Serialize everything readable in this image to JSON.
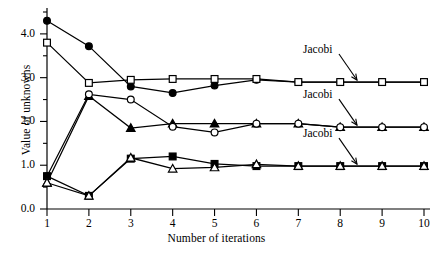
{
  "chart_data": {
    "type": "line",
    "title": "",
    "xlabel": "Number of iterations",
    "ylabel": "Value of unknowns",
    "xlim": [
      1,
      10
    ],
    "ylim": [
      0.0,
      4.5
    ],
    "grid": false,
    "legend_position": "none",
    "x": [
      1,
      2,
      3,
      4,
      5,
      6,
      7,
      8,
      9,
      10
    ],
    "xticks": [
      "1",
      "2",
      "3",
      "4",
      "5",
      "6",
      "7",
      "8",
      "9",
      "10"
    ],
    "yticks": [
      "0.0",
      "1.0",
      "2.0",
      "3.0",
      "4.0"
    ],
    "series": [
      {
        "name": "unknown-1-gauss-seidel",
        "marker": "filled-circle",
        "values": [
          4.3,
          3.72,
          2.8,
          2.65,
          2.82,
          2.95,
          2.9,
          2.9,
          2.9,
          2.9
        ]
      },
      {
        "name": "unknown-1-jacobi",
        "marker": "open-square",
        "values": [
          3.8,
          2.88,
          2.95,
          2.97,
          2.97,
          2.97,
          2.9,
          2.9,
          2.9,
          2.9
        ]
      },
      {
        "name": "unknown-2-gauss-seidel",
        "marker": "filled-triangle",
        "values": [
          0.6,
          2.58,
          1.85,
          1.95,
          1.95,
          1.95,
          1.95,
          1.87,
          1.87,
          1.87
        ]
      },
      {
        "name": "unknown-2-jacobi",
        "marker": "open-circle",
        "values": [
          0.75,
          2.62,
          2.5,
          1.88,
          1.75,
          1.95,
          1.95,
          1.87,
          1.87,
          1.87
        ]
      },
      {
        "name": "unknown-3-gauss-seidel",
        "marker": "filled-square",
        "values": [
          0.75,
          0.3,
          1.15,
          1.2,
          1.03,
          0.98,
          0.98,
          0.98,
          0.98,
          0.98
        ]
      },
      {
        "name": "unknown-3-jacobi",
        "marker": "open-triangle",
        "values": [
          0.6,
          0.3,
          1.17,
          0.92,
          0.95,
          1.02,
          0.98,
          0.98,
          0.98,
          0.98
        ]
      }
    ],
    "annotations": [
      {
        "text": "Jacobi",
        "target_x": 8.4,
        "target_y": 2.9
      },
      {
        "text": "Jacobi",
        "target_x": 8.4,
        "target_y": 1.87
      },
      {
        "text": "Jacobi",
        "target_x": 8.4,
        "target_y": 0.98
      }
    ]
  }
}
